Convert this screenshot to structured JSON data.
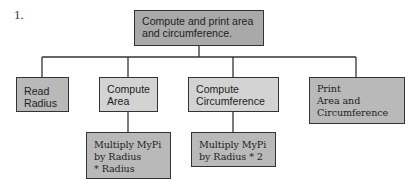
{
  "figure_number": "1.",
  "root": {
    "label": "Compute and print area\nand circumference.",
    "fill": "#a9a9a9"
  },
  "level1": [
    {
      "id": "read-radius",
      "label": "Read\nRadius",
      "fill": "#b9b9b9"
    },
    {
      "id": "compute-area",
      "label": "Compute\nArea",
      "fill": "#d3d3d3"
    },
    {
      "id": "compute-circumference",
      "label": "Compute\nCircumference",
      "fill": "#d3d3d3"
    },
    {
      "id": "print-area-circumference",
      "label": "Print\nArea and\nCircumference",
      "fill": "#b9b9b9"
    }
  ],
  "level2": [
    {
      "id": "multiply-area",
      "parent": "compute-area",
      "label": "Multiply MyPi\nby Radius\n* Radius",
      "fill": "#b9b9b9"
    },
    {
      "id": "multiply-circumference",
      "parent": "compute-circumference",
      "label": "Multiply MyPi\nby Radius * 2",
      "fill": "#b9b9b9"
    }
  ],
  "line_color": "#333333"
}
